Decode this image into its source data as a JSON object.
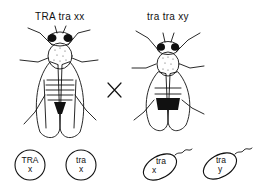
{
  "parents": {
    "female": {
      "genotype": "TRA tra xx",
      "sex": "female"
    },
    "male": {
      "genotype": "tra tra xy",
      "sex": "male"
    },
    "cross_symbol": "×"
  },
  "gametes": {
    "eggs": [
      {
        "gene": "TRA",
        "chromosome": "x"
      },
      {
        "gene": "tra",
        "chromosome": "x"
      }
    ],
    "sperm": [
      {
        "gene": "tra",
        "chromosome": "x"
      },
      {
        "gene": "tra",
        "chromosome": "y"
      }
    ]
  },
  "colors": {
    "ink": "#111111",
    "background": "#ffffff"
  }
}
